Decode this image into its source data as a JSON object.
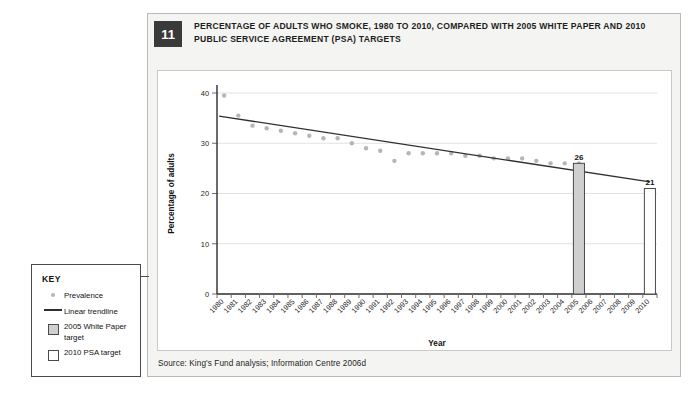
{
  "figure": {
    "number": "11",
    "title": "PERCENTAGE OF ADULTS WHO SMOKE, 1980 TO 2010, COMPARED WITH 2005 WHITE PAPER AND 2010 PUBLIC SERVICE AGREEMENT (PSA) TARGETS",
    "source": "Source: King's Fund analysis; Information Centre 2006d"
  },
  "key": {
    "title": "KEY",
    "items": [
      {
        "symbol": "dot",
        "label": "Prevalence"
      },
      {
        "symbol": "line",
        "label": "Linear trendline"
      },
      {
        "symbol": "grey-square",
        "label": "2005 White Paper target"
      },
      {
        "symbol": "white-square",
        "label": "2010 PSA target"
      }
    ]
  },
  "colors": {
    "dot": "#b6b6b6",
    "trendline": "#2f2f2f",
    "bar_2005": "#cfcfcf",
    "bar_2010": "#ffffff",
    "bar_border": "#4a4a4a",
    "badge": "#3a3a3a",
    "frame": "#b9b9b5",
    "panel_bg": "#f4f4f2",
    "grid": "#e2e2e2"
  },
  "chart_data": {
    "type": "scatter",
    "title": "PERCENTAGE OF ADULTS WHO SMOKE, 1980 TO 2010, COMPARED WITH 2005 WHITE PAPER AND 2010 PUBLIC SERVICE AGREEMENT (PSA) TARGETS",
    "xlabel": "Year",
    "ylabel": "Percentage of adults",
    "ylim": [
      0,
      40
    ],
    "yticks": [
      0,
      10,
      20,
      30,
      40
    ],
    "ytick_labels": [
      "0",
      "10",
      "20",
      "30",
      "40"
    ],
    "grid": true,
    "legend_position": "outside-left",
    "categories": [
      "1980",
      "1981",
      "1982",
      "1983",
      "1984",
      "1985",
      "1986",
      "1987",
      "1988",
      "1989",
      "1990",
      "1991",
      "1992",
      "1993",
      "1994",
      "1995",
      "1996",
      "1997",
      "1998",
      "1999",
      "2000",
      "2001",
      "2002",
      "2003",
      "2004",
      "2005",
      "2006",
      "2007",
      "2008",
      "2009",
      "2010"
    ],
    "series": [
      {
        "name": "Prevalence",
        "type": "scatter",
        "marker": "dot",
        "color": "#b6b6b6",
        "x": [
          "1980",
          "1981",
          "1982",
          "1983",
          "1984",
          "1985",
          "1986",
          "1987",
          "1988",
          "1989",
          "1990",
          "1991",
          "1992",
          "1993",
          "1994",
          "1995",
          "1996",
          "1997",
          "1998",
          "1999",
          "2000",
          "2001",
          "2002",
          "2003",
          "2004",
          "2005"
        ],
        "values": [
          39.5,
          35.5,
          33.5,
          33,
          32.5,
          32,
          31.5,
          31,
          31,
          30,
          29,
          28.5,
          26.5,
          28,
          28,
          28,
          28,
          27.5,
          27.5,
          27,
          27,
          27,
          26.5,
          26,
          26,
          26
        ]
      },
      {
        "name": "Linear trendline",
        "type": "line",
        "color": "#2f2f2f",
        "start": {
          "x": "1980",
          "y": 35.4
        },
        "end": {
          "x": "2010",
          "y": 22.3
        }
      },
      {
        "name": "2005 White Paper target",
        "type": "bar",
        "color": "#cfcfcf",
        "x": [
          "2005"
        ],
        "values": [
          26
        ],
        "data_labels": [
          "26"
        ]
      },
      {
        "name": "2010 PSA target",
        "type": "bar",
        "color": "#ffffff",
        "x": [
          "2010"
        ],
        "values": [
          21
        ],
        "data_labels": [
          "21"
        ]
      }
    ]
  }
}
